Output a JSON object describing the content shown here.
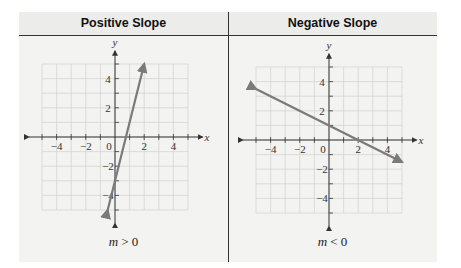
{
  "panels": [
    {
      "title": "Positive Slope",
      "caption_var": "m",
      "caption_op": ">",
      "caption_val": "0"
    },
    {
      "title": "Negative Slope",
      "caption_var": "m",
      "caption_op": "<",
      "caption_val": "0"
    }
  ],
  "axes": {
    "xlabel": "x",
    "ylabel": "y",
    "xticks": [
      "-4",
      "-2",
      "0",
      "2",
      "4"
    ],
    "yticks": [
      "4",
      "2",
      "-2",
      "-4"
    ]
  },
  "colors": {
    "line": "#7a7a7a",
    "grid": "#d4d4d4",
    "axis": "#333333"
  },
  "chart_data": [
    {
      "type": "line",
      "title": "Positive Slope",
      "xlabel": "x",
      "ylabel": "y",
      "xlim": [
        -5,
        5
      ],
      "ylim": [
        -5,
        5
      ],
      "grid": true,
      "series": [
        {
          "name": "line",
          "x": [
            -0.5,
            2
          ],
          "y": [
            -5,
            5
          ]
        }
      ],
      "slope": 4,
      "y_intercept": -3,
      "annotation": "m > 0"
    },
    {
      "type": "line",
      "title": "Negative Slope",
      "xlabel": "x",
      "ylabel": "y",
      "xlim": [
        -5,
        5
      ],
      "ylim": [
        -5,
        5
      ],
      "grid": true,
      "series": [
        {
          "name": "line",
          "x": [
            -5,
            5
          ],
          "y": [
            3.5,
            -1.5
          ]
        }
      ],
      "slope": -0.5,
      "y_intercept": 1,
      "annotation": "m < 0"
    }
  ]
}
